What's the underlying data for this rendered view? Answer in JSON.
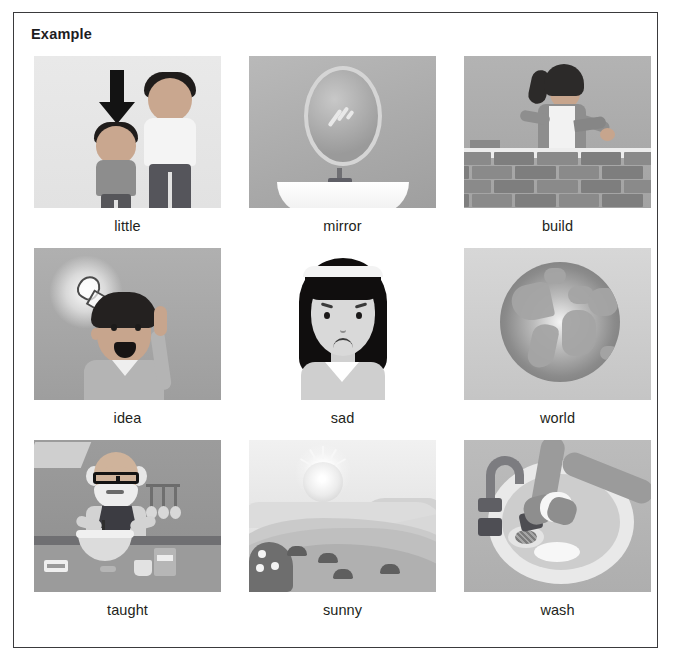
{
  "worksheet": {
    "heading": "Example",
    "border_color": "#3a3a3c",
    "background_color": "#ffffff"
  },
  "grid": {
    "columns": 3,
    "rows": 3,
    "cells": [
      {
        "label": "little",
        "picture": "two-children-height-comparison-with-arrow"
      },
      {
        "label": "mirror",
        "picture": "oval-mirror-above-bathroom-sink"
      },
      {
        "label": "build",
        "picture": "woman-laying-bricks-with-trowel"
      },
      {
        "label": "idea",
        "picture": "boy-with-glowing-lightbulb-pointing-up"
      },
      {
        "label": "sad",
        "picture": "girl-with-long-black-hair-frowning"
      },
      {
        "label": "world",
        "picture": "globe-showing-continents"
      },
      {
        "label": "taught",
        "picture": "older-man-with-glasses-baking-in-kitchen"
      },
      {
        "label": "sunny",
        "picture": "sun-over-rolling-hills-landscape"
      },
      {
        "label": "wash",
        "picture": "hands-washing-dishes-in-sink"
      }
    ]
  }
}
